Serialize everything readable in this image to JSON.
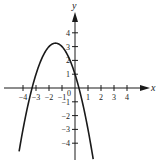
{
  "chart_data": {
    "type": "line",
    "title": "",
    "xlabel": "x",
    "ylabel": "y",
    "function": "y = -x^2 - 3x + 1",
    "xlim": [
      -4.6,
      5.0
    ],
    "ylim": [
      -5.7,
      5.2
    ],
    "x_ticks": [
      -4,
      -3,
      -2,
      -1,
      1,
      2,
      3,
      4
    ],
    "y_ticks": [
      -4,
      -3,
      -2,
      -1,
      1,
      2,
      3,
      4
    ],
    "origin_label": "0",
    "grid": false,
    "legend": null,
    "series": [
      {
        "name": "parabola",
        "x": [
          -4.3,
          -4.0,
          -3.5,
          -3.0,
          -2.5,
          -2.0,
          -1.5,
          -1.0,
          -0.5,
          0.0,
          0.5,
          1.0,
          1.5
        ],
        "y": [
          -4.59,
          -3.0,
          -0.75,
          1.0,
          2.25,
          3.0,
          3.25,
          3.0,
          2.25,
          1.0,
          -0.75,
          -3.0,
          -5.75
        ]
      }
    ],
    "key_points": {
      "vertex": [
        -1.5,
        3.25
      ],
      "y_intercept": [
        0,
        1
      ],
      "x_intercepts": [
        -3.3,
        0.3
      ]
    }
  },
  "axes": {
    "x_label": "x",
    "y_label": "y",
    "origin": "0",
    "x_tick_labels": [
      "-4",
      "-3",
      "-2",
      "-1",
      "1",
      "2",
      "3",
      "4"
    ],
    "y_tick_labels": [
      "4",
      "3",
      "2",
      "1",
      "-1",
      "-2",
      "-3",
      "-4"
    ]
  },
  "colors": {
    "curve": "#1a1a1a",
    "axes": "#1a1a1a",
    "background": "#ffffff"
  }
}
